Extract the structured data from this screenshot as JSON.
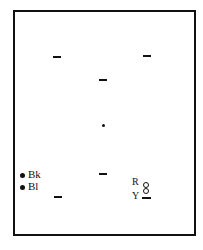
{
  "diagram": {
    "labels": {
      "black": "Bk",
      "blue": "Bl",
      "red": "R",
      "yellow": "Y"
    },
    "marks": [
      {
        "type": "dash",
        "x": 57,
        "y": 57
      },
      {
        "type": "dash",
        "x": 147,
        "y": 56
      },
      {
        "type": "dash",
        "x": 103,
        "y": 80
      },
      {
        "type": "dot",
        "x": 103,
        "y": 125
      },
      {
        "type": "dash",
        "x": 103,
        "y": 174
      },
      {
        "type": "dash",
        "x": 58,
        "y": 197
      }
    ],
    "colors": {
      "ink": "#111111",
      "background": "#ffffff"
    }
  }
}
